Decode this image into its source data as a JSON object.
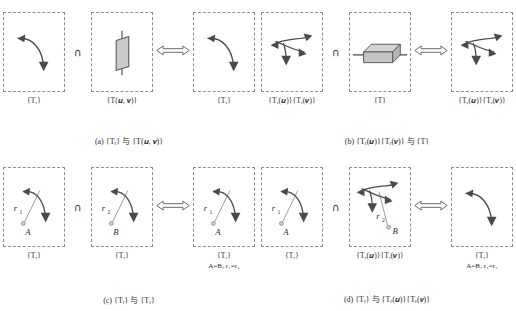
{
  "figure": {
    "symbols": {
      "intersection": "∩",
      "chinese_and": "与"
    },
    "colors": {
      "stroke": "#4a4a4a",
      "dashed_box": "#8d8d8d",
      "mirror_fill": "#c9c9c9",
      "axis_fill": "#c4c4c4",
      "text": "#2b2b2b"
    },
    "panels": [
      {
        "id": "a",
        "caption": "(a) {Tᵣ} 与 {T(𝒖, 𝒗)}",
        "caption_parts": {
          "tag": "(a)",
          "left": "{Tᵣ}",
          "conj": "与",
          "right": "{T(u, v)}"
        },
        "boxes": [
          {
            "name": "rotation-set-left",
            "label": "{Tᵣ}",
            "glyph": "rotation-arrow"
          },
          {
            "name": "mirror-set-middle",
            "label": "{T(𝒖, 𝒗)}",
            "glyph": "mirror-plane"
          },
          {
            "name": "rotation-set-right",
            "label": "{Tᵣ}",
            "glyph": "rotation-arrow"
          }
        ],
        "operator": "∩",
        "connector": "double-headed-hollow-arrow"
      },
      {
        "id": "b",
        "caption": "(b) {Tᵣ(𝒖)}{Tᵣ(𝒗)} 与 {T}",
        "caption_parts": {
          "tag": "(b)",
          "left": "{Tᵣ(u)}{Tᵣ(v)}",
          "conj": "与",
          "right": "{T}"
        },
        "boxes": [
          {
            "name": "double-rotation-set-left",
            "label": "{Tᵣ(𝒖)}{Tᵣ(𝒗)}",
            "glyph": "double-rotation-arrows"
          },
          {
            "name": "translation-set-middle",
            "label": "{T}",
            "glyph": "axis-box"
          },
          {
            "name": "double-rotation-set-right",
            "label": "{Tᵣ(𝒖)}{Tᵣ(𝒗)}",
            "glyph": "double-rotation-arrows"
          }
        ],
        "operator": "∩",
        "connector": "double-headed-hollow-arrow"
      },
      {
        "id": "c",
        "caption": "(c) {Tᵣ} 与 {Tᵣ}",
        "caption_parts": {
          "tag": "(c)",
          "left": "{Tᵣ}",
          "conj": "与",
          "right": "{Tᵣ}"
        },
        "boxes": [
          {
            "name": "rotation-axis-A-box",
            "label": "{Tᵣ}",
            "glyph": "rotation-with-axis",
            "axis_label": "r₁",
            "point_label": "A"
          },
          {
            "name": "rotation-axis-B-box",
            "label": "{Tᵣ}",
            "glyph": "rotation-with-axis",
            "axis_label": "r₂",
            "point_label": "B"
          },
          {
            "name": "rotation-result-box",
            "label": "{Tᵣ}",
            "sublabel": "A=B, r₁=r₂",
            "glyph": "rotation-with-axis",
            "axis_label": "r₁",
            "point_label": "A"
          }
        ],
        "operator": "∩",
        "connector": "double-headed-hollow-arrow"
      },
      {
        "id": "d",
        "caption": "(d) {Tᵣ} 与 {Tᵣ(𝒖)}{Tᵣ(𝒗)}",
        "caption_parts": {
          "tag": "(d)",
          "left": "{Tᵣ}",
          "conj": "与",
          "right": "{Tᵣ(u)}{Tᵣ(v)}"
        },
        "boxes": [
          {
            "name": "rotation-axis-A-box",
            "label": "{Tᵣ}",
            "glyph": "rotation-with-axis",
            "axis_label": "r₁",
            "point_label": "A"
          },
          {
            "name": "double-rotation-axis-B-box",
            "label": "{Tᵣ(𝒖)}{Tᵣ(𝒗)}",
            "glyph": "double-rotation-with-axis",
            "axis_label": "r₂",
            "point_label": "B"
          },
          {
            "name": "rotation-result-box",
            "label": "{Tᵣ}",
            "sublabel": "A=B, r₁=r₂",
            "glyph": "rotation-arrow"
          }
        ],
        "operator": "∩",
        "connector": "double-headed-hollow-arrow"
      }
    ]
  }
}
